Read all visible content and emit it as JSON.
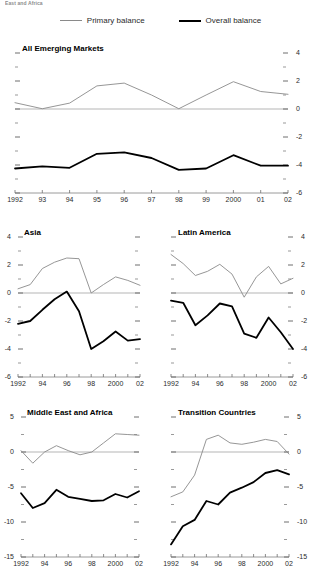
{
  "caption_top": "East and Africa",
  "legend": {
    "items": [
      {
        "label": "Primary balance",
        "key": "primary",
        "color": "#8a8a8a"
      },
      {
        "label": "Overall balance",
        "key": "overall",
        "color": "#000000"
      }
    ]
  },
  "chart_data": [
    {
      "type": "line",
      "title": "All Emerging Markets",
      "xlabel": "",
      "ylabel": "",
      "x": [
        1992,
        1993,
        1994,
        1995,
        1996,
        1997,
        1998,
        1999,
        2000,
        2001,
        2002
      ],
      "tick_labels_x": [
        "1992",
        "93",
        "94",
        "95",
        "96",
        "97",
        "98",
        "99",
        "2000",
        "01",
        "02"
      ],
      "ylim": [
        -6,
        4
      ],
      "yticks": [
        4,
        2,
        0,
        -2,
        -4,
        -6
      ],
      "ytick_labels": [
        "4",
        "2",
        "0",
        "-2",
        "-4",
        "-6"
      ],
      "y_axis_side": "right",
      "grid": false,
      "zero_line": true,
      "series": [
        {
          "name": "Primary balance",
          "color": "#8a8a8a",
          "width": 0.9,
          "values": [
            0.45,
            0.02,
            0.42,
            1.65,
            1.85,
            1.0,
            0.02,
            1.0,
            1.95,
            1.25,
            1.05
          ]
        },
        {
          "name": "Overall balance",
          "color": "#000000",
          "width": 1.8,
          "values": [
            -4.25,
            -4.1,
            -4.2,
            -3.2,
            -3.1,
            -3.5,
            -4.35,
            -4.25,
            -3.3,
            -4.05,
            -4.05
          ]
        }
      ]
    },
    {
      "type": "line",
      "title": "Asia",
      "xlabel": "",
      "ylabel": "",
      "x": [
        1992,
        1993,
        1994,
        1995,
        1996,
        1997,
        1998,
        1999,
        2000,
        2001,
        2002
      ],
      "tick_labels_x": [
        "1992",
        "94",
        "96",
        "98",
        "2000",
        "02"
      ],
      "ylim": [
        -6,
        4
      ],
      "yticks": [
        4,
        2,
        0,
        -2,
        -4,
        -6
      ],
      "ytick_labels": [
        "4",
        "2",
        "0",
        "-2",
        "-4",
        "-6"
      ],
      "y_axis_side": "left",
      "grid": false,
      "zero_line": true,
      "series": [
        {
          "name": "Primary balance",
          "color": "#8a8a8a",
          "width": 0.9,
          "values": [
            0.3,
            0.6,
            1.75,
            2.2,
            2.5,
            2.45,
            0.0,
            0.6,
            1.15,
            0.9,
            0.55
          ]
        },
        {
          "name": "Overall balance",
          "color": "#000000",
          "width": 1.8,
          "values": [
            -2.2,
            -2.0,
            -1.2,
            -0.45,
            0.1,
            -1.3,
            -4.0,
            -3.45,
            -2.75,
            -3.4,
            -3.3
          ]
        }
      ]
    },
    {
      "type": "line",
      "title": "Latin America",
      "xlabel": "",
      "ylabel": "",
      "x": [
        1992,
        1993,
        1994,
        1995,
        1996,
        1997,
        1998,
        1999,
        2000,
        2001,
        2002
      ],
      "tick_labels_x": [
        "1992",
        "94",
        "96",
        "98",
        "2000",
        "02"
      ],
      "ylim": [
        -6,
        4
      ],
      "yticks": [
        4,
        2,
        0,
        -2,
        -4,
        -6
      ],
      "ytick_labels": [
        "4",
        "2",
        "0",
        "-2",
        "-4",
        "-6"
      ],
      "y_axis_side": "right",
      "grid": false,
      "zero_line": true,
      "series": [
        {
          "name": "Primary balance",
          "color": "#8a8a8a",
          "width": 0.9,
          "values": [
            2.75,
            2.1,
            1.25,
            1.55,
            2.05,
            1.35,
            -0.3,
            1.15,
            1.9,
            0.65,
            1.05
          ]
        },
        {
          "name": "Overall balance",
          "color": "#000000",
          "width": 1.8,
          "values": [
            -0.55,
            -0.7,
            -2.3,
            -1.6,
            -0.75,
            -0.95,
            -2.9,
            -3.2,
            -1.75,
            -2.8,
            -4.0
          ]
        }
      ]
    },
    {
      "type": "line",
      "title": "Middle East and Africa",
      "xlabel": "",
      "ylabel": "",
      "x": [
        1992,
        1993,
        1994,
        1995,
        1996,
        1997,
        1998,
        1999,
        2000,
        2001,
        2002
      ],
      "tick_labels_x": [
        "1992",
        "94",
        "96",
        "98",
        "2000",
        "02"
      ],
      "ylim": [
        -15,
        5
      ],
      "yticks": [
        5,
        0,
        -5,
        -10,
        -15
      ],
      "ytick_labels": [
        "5",
        "0",
        "-5",
        "-10",
        "-15"
      ],
      "y_axis_side": "left",
      "grid": false,
      "zero_line": true,
      "series": [
        {
          "name": "Primary balance",
          "color": "#8a8a8a",
          "width": 0.9,
          "values": [
            0.2,
            -1.6,
            0.0,
            0.9,
            0.2,
            -0.4,
            0.0,
            1.3,
            2.6,
            2.5,
            2.4
          ]
        },
        {
          "name": "Overall balance",
          "color": "#000000",
          "width": 1.8,
          "values": [
            -5.9,
            -8.0,
            -7.3,
            -5.4,
            -6.4,
            -6.7,
            -7.0,
            -6.9,
            -6.0,
            -6.5,
            -5.6
          ]
        }
      ]
    },
    {
      "type": "line",
      "title": "Transition Countries",
      "xlabel": "",
      "ylabel": "",
      "x": [
        1992,
        1993,
        1994,
        1995,
        1996,
        1997,
        1998,
        1999,
        2000,
        2001,
        2002
      ],
      "tick_labels_x": [
        "1992",
        "94",
        "96",
        "98",
        "2000",
        "02"
      ],
      "ylim": [
        -15,
        5
      ],
      "yticks": [
        5,
        0,
        -5,
        -10,
        -15
      ],
      "ytick_labels": [
        "5",
        "0",
        "-5",
        "-10",
        "-15"
      ],
      "y_axis_side": "right",
      "grid": false,
      "zero_line": true,
      "series": [
        {
          "name": "Primary balance",
          "color": "#8a8a8a",
          "width": 0.9,
          "values": [
            -6.4,
            -5.7,
            -3.3,
            1.8,
            2.4,
            1.3,
            1.1,
            1.4,
            1.8,
            1.5,
            -0.3
          ]
        },
        {
          "name": "Overall balance",
          "color": "#000000",
          "width": 1.8,
          "values": [
            -13.2,
            -10.6,
            -9.7,
            -7.0,
            -7.5,
            -5.8,
            -5.1,
            -4.3,
            -3.0,
            -2.6,
            -3.2
          ]
        }
      ]
    }
  ]
}
